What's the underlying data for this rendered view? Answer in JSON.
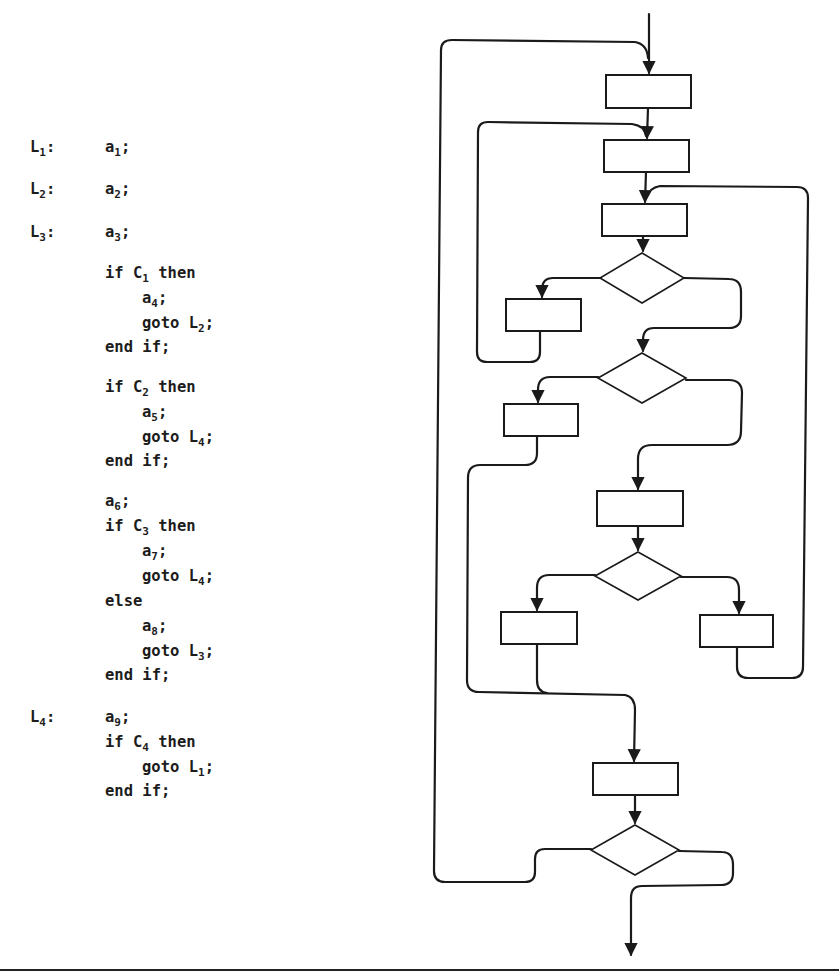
{
  "code_listing": {
    "lines": [
      {
        "label": "L",
        "label_sub": "1",
        "label_suffix": ":",
        "indent": 0,
        "text": "a",
        "sub": "1",
        "suffix": ";",
        "y": 150
      },
      {
        "label": "L",
        "label_sub": "2",
        "label_suffix": ":",
        "indent": 0,
        "text": "a",
        "sub": "2",
        "suffix": ";",
        "y": 192
      },
      {
        "label": "L",
        "label_sub": "3",
        "label_suffix": ":",
        "indent": 0,
        "text": "a",
        "sub": "3",
        "suffix": ";",
        "y": 235
      },
      {
        "label": "",
        "indent": 0,
        "text": "if C",
        "sub": "1",
        "suffix": " then",
        "y": 276
      },
      {
        "label": "",
        "indent": 1,
        "text": "a",
        "sub": "4",
        "suffix": ";",
        "y": 301
      },
      {
        "label": "",
        "indent": 1,
        "text": "goto L",
        "sub": "2",
        "suffix": ";",
        "y": 326
      },
      {
        "label": "",
        "indent": 0,
        "text": "end if;",
        "sub": "",
        "suffix": "",
        "y": 350
      },
      {
        "label": "",
        "indent": 0,
        "text": "if C",
        "sub": "2",
        "suffix": " then",
        "y": 390
      },
      {
        "label": "",
        "indent": 1,
        "text": "a",
        "sub": "5",
        "suffix": ";",
        "y": 415
      },
      {
        "label": "",
        "indent": 1,
        "text": "goto L",
        "sub": "4",
        "suffix": ";",
        "y": 440
      },
      {
        "label": "",
        "indent": 0,
        "text": "end if;",
        "sub": "",
        "suffix": "",
        "y": 464
      },
      {
        "label": "",
        "indent": 0,
        "text": "a",
        "sub": "6",
        "suffix": ";",
        "y": 504
      },
      {
        "label": "",
        "indent": 0,
        "text": "if C",
        "sub": "3",
        "suffix": " then",
        "y": 529
      },
      {
        "label": "",
        "indent": 1,
        "text": "a",
        "sub": "7",
        "suffix": ";",
        "y": 554
      },
      {
        "label": "",
        "indent": 1,
        "text": "goto L",
        "sub": "4",
        "suffix": ";",
        "y": 579
      },
      {
        "label": "",
        "indent": 0,
        "text": "else",
        "sub": "",
        "suffix": "",
        "y": 604
      },
      {
        "label": "",
        "indent": 1,
        "text": "a",
        "sub": "8",
        "suffix": ";",
        "y": 629
      },
      {
        "label": "",
        "indent": 1,
        "text": "goto L",
        "sub": "3",
        "suffix": ";",
        "y": 654
      },
      {
        "label": "",
        "indent": 0,
        "text": "end if;",
        "sub": "",
        "suffix": "",
        "y": 678
      },
      {
        "label": "L",
        "label_sub": "4",
        "label_suffix": ":",
        "indent": 0,
        "text": "a",
        "sub": "9",
        "suffix": ";",
        "y": 720
      },
      {
        "label": "",
        "indent": 0,
        "text": "if C",
        "sub": "4",
        "suffix": " then",
        "y": 745
      },
      {
        "label": "",
        "indent": 1,
        "text": "goto L",
        "sub": "1",
        "suffix": ";",
        "y": 770
      },
      {
        "label": "",
        "indent": 0,
        "text": "end if;",
        "sub": "",
        "suffix": "",
        "y": 794
      }
    ]
  },
  "flowchart": {
    "stroke_color": "#1a1a1a",
    "nodes": [
      {
        "id": "a1",
        "type": "process",
        "x": 606,
        "y": 75,
        "w": 85,
        "h": 33
      },
      {
        "id": "a2",
        "type": "process",
        "x": 604,
        "y": 140,
        "w": 85,
        "h": 32
      },
      {
        "id": "a3",
        "type": "process",
        "x": 602,
        "y": 204,
        "w": 85,
        "h": 32
      },
      {
        "id": "C1",
        "type": "decision",
        "cx": 642,
        "cy": 278,
        "hw": 42,
        "hh": 25
      },
      {
        "id": "a4",
        "type": "process",
        "x": 506,
        "y": 299,
        "w": 75,
        "h": 32
      },
      {
        "id": "C2",
        "type": "decision",
        "cx": 642,
        "cy": 378,
        "hw": 44,
        "hh": 25
      },
      {
        "id": "a5",
        "type": "process",
        "x": 504,
        "y": 404,
        "w": 74,
        "h": 32
      },
      {
        "id": "a6",
        "type": "process",
        "x": 597,
        "y": 491,
        "w": 86,
        "h": 35
      },
      {
        "id": "C3",
        "type": "decision",
        "cx": 638,
        "cy": 576,
        "hw": 43,
        "hh": 24
      },
      {
        "id": "a7",
        "type": "process",
        "x": 501,
        "y": 612,
        "w": 76,
        "h": 32
      },
      {
        "id": "a8",
        "type": "process",
        "x": 700,
        "y": 615,
        "w": 73,
        "h": 32
      },
      {
        "id": "a9",
        "type": "process",
        "x": 593,
        "y": 763,
        "w": 85,
        "h": 32
      },
      {
        "id": "C4",
        "type": "decision",
        "cx": 635,
        "cy": 850,
        "hw": 44,
        "hh": 25
      }
    ]
  },
  "footer_rule": true
}
